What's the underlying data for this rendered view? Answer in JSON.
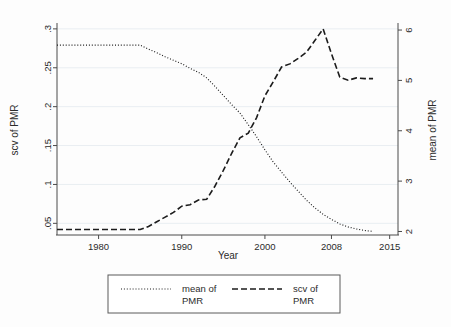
{
  "chart_data": {
    "type": "line",
    "title": "",
    "xlabel": "Year",
    "ylabel": "scv of PMR",
    "y2label": "mean of PMR",
    "grid": true,
    "legend_position": "bottom",
    "xlim": [
      1975,
      2016
    ],
    "xticks": [
      1980,
      1990,
      2000,
      2008,
      2015
    ],
    "xticklabels": [
      "1980",
      "1990",
      "2000",
      "2008",
      "2015"
    ],
    "ylim": [
      0.035,
      0.305
    ],
    "yticks": [
      0.05,
      0.1,
      0.15,
      0.2,
      0.25,
      0.3
    ],
    "yticklabels": [
      ".05",
      ".1",
      ".15",
      ".2",
      ".25",
      ".3"
    ],
    "y2lim": [
      1.93,
      6.1
    ],
    "y2ticks": [
      2,
      3,
      4,
      5,
      6
    ],
    "y2ticklabels": [
      "2",
      "3",
      "4",
      "5",
      "6"
    ],
    "series": [
      {
        "name": "mean of PMR",
        "axis": "right",
        "style": "dotted",
        "x": [
          1975,
          1976,
          1977,
          1978,
          1979,
          1980,
          1981,
          1982,
          1983,
          1984,
          1985,
          1986,
          1987,
          1988,
          1989,
          1990,
          1991,
          1992,
          1993,
          1994,
          1995,
          1996,
          1997,
          1998,
          1999,
          2000,
          2001,
          2002,
          2003,
          2004,
          2005,
          2006,
          2007,
          2008,
          2009,
          2010,
          2011,
          2012,
          2013
        ],
        "values": [
          5.7,
          5.7,
          5.7,
          5.7,
          5.7,
          5.7,
          5.7,
          5.7,
          5.7,
          5.7,
          5.7,
          5.62,
          5.55,
          5.47,
          5.4,
          5.33,
          5.24,
          5.16,
          5.05,
          4.88,
          4.7,
          4.52,
          4.35,
          4.12,
          3.88,
          3.62,
          3.38,
          3.18,
          2.98,
          2.8,
          2.62,
          2.47,
          2.34,
          2.24,
          2.15,
          2.09,
          2.05,
          2.02,
          2.0
        ],
        "ylabel_axis": "mean of PMR"
      },
      {
        "name": "scv of PMR",
        "axis": "left",
        "style": "dashed",
        "x": [
          1975,
          1976,
          1977,
          1978,
          1979,
          1980,
          1981,
          1982,
          1983,
          1984,
          1985,
          1986,
          1987,
          1988,
          1989,
          1990,
          1991,
          1992,
          1993,
          1994,
          1995,
          1996,
          1997,
          1998,
          1999,
          2000,
          2001,
          2002,
          2003,
          2004,
          2005,
          2006,
          2007,
          2008,
          2009,
          2010,
          2011,
          2012,
          2013
        ],
        "values": [
          0.042,
          0.042,
          0.042,
          0.042,
          0.042,
          0.042,
          0.042,
          0.042,
          0.042,
          0.042,
          0.042,
          0.046,
          0.052,
          0.058,
          0.064,
          0.072,
          0.074,
          0.08,
          0.081,
          0.098,
          0.118,
          0.14,
          0.16,
          0.166,
          0.186,
          0.214,
          0.232,
          0.251,
          0.255,
          0.262,
          0.27,
          0.285,
          0.3,
          0.268,
          0.238,
          0.234,
          0.237,
          0.236,
          0.236
        ],
        "ylabel_axis": "scv of PMR"
      }
    ],
    "legend": [
      {
        "label_line1": "mean of",
        "label_line2": "PMR",
        "style": "dotted"
      },
      {
        "label_line1": "scv of",
        "label_line2": "PMR",
        "style": "dashed"
      }
    ],
    "colors": {
      "line": "#1c1c1c",
      "axis": "#4a4a4a",
      "grid": "#e9eef2",
      "background": "#fdfdfd"
    }
  }
}
